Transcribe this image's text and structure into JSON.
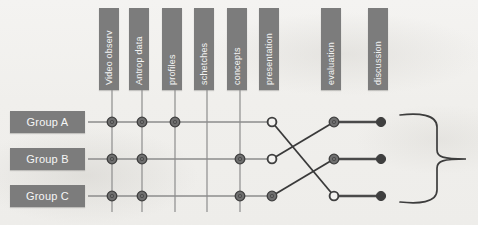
{
  "figure": {
    "background_color": "#f2f1ef",
    "bar_color": "#7c7c7c",
    "label_color": "#f4f4f4",
    "line_color": "#8d8d8d",
    "cross_line_color": "#3a3a3a",
    "node_fill_color": "#6f6f6f",
    "node_dark_color": "#3f3f3f"
  },
  "columns": [
    {
      "id": "video-observ",
      "label": "Video observ",
      "x": 112,
      "bar_x": 99,
      "bar_y": 8,
      "bar_w": 20,
      "bar_h": 82,
      "has_grid_line": true
    },
    {
      "id": "antrop-data",
      "label": "Antrop data",
      "x": 142,
      "bar_x": 129,
      "bar_y": 8,
      "bar_w": 20,
      "bar_h": 82,
      "has_grid_line": true
    },
    {
      "id": "profiles",
      "label": "profiles",
      "x": 175,
      "bar_x": 162,
      "bar_y": 8,
      "bar_w": 20,
      "bar_h": 82,
      "has_grid_line": true
    },
    {
      "id": "schetches",
      "label": "schetches",
      "x": 207,
      "bar_x": 194,
      "bar_y": 8,
      "bar_w": 20,
      "bar_h": 82,
      "has_grid_line": true
    },
    {
      "id": "concepts",
      "label": "concepts",
      "x": 240,
      "bar_x": 227,
      "bar_y": 8,
      "bar_w": 20,
      "bar_h": 82,
      "has_grid_line": true
    },
    {
      "id": "presentation",
      "label": "presentation",
      "x": 272,
      "bar_x": 259,
      "bar_y": 8,
      "bar_w": 20,
      "bar_h": 82,
      "has_grid_line": false
    },
    {
      "id": "evaluation",
      "label": "evaluation",
      "x": 334,
      "bar_x": 321,
      "bar_y": 8,
      "bar_w": 20,
      "bar_h": 82,
      "has_grid_line": false
    },
    {
      "id": "discussion",
      "label": "discussion",
      "x": 381,
      "bar_x": 368,
      "bar_y": 8,
      "bar_w": 20,
      "bar_h": 82,
      "has_grid_line": false
    }
  ],
  "groups": [
    {
      "id": "group-a",
      "label": "Group A",
      "y": 122,
      "box_x": 10,
      "box_y": 111,
      "box_w": 75,
      "box_h": 22
    },
    {
      "id": "group-b",
      "label": "Group B",
      "y": 159,
      "box_x": 10,
      "box_y": 148,
      "box_w": 75,
      "box_h": 22
    },
    {
      "id": "group-c",
      "label": "Group C",
      "y": 196,
      "box_x": 10,
      "box_y": 185,
      "box_w": 75,
      "box_h": 22
    }
  ],
  "nodes": [
    {
      "group": "group-a",
      "column": "video-observ",
      "x": 112,
      "y": 122,
      "style": "filled"
    },
    {
      "group": "group-a",
      "column": "antrop-data",
      "x": 142,
      "y": 122,
      "style": "filled"
    },
    {
      "group": "group-a",
      "column": "profiles",
      "x": 175,
      "y": 122,
      "style": "filled"
    },
    {
      "group": "group-a",
      "column": "presentation",
      "x": 272,
      "y": 122,
      "style": "hollow"
    },
    {
      "group": "group-b",
      "column": "video-observ",
      "x": 112,
      "y": 159,
      "style": "filled"
    },
    {
      "group": "group-b",
      "column": "antrop-data",
      "x": 142,
      "y": 159,
      "style": "filled"
    },
    {
      "group": "group-b",
      "column": "concepts",
      "x": 240,
      "y": 159,
      "style": "filled"
    },
    {
      "group": "group-b",
      "column": "presentation",
      "x": 272,
      "y": 159,
      "style": "hollow"
    },
    {
      "group": "group-c",
      "column": "video-observ",
      "x": 112,
      "y": 196,
      "style": "filled"
    },
    {
      "group": "group-c",
      "column": "antrop-data",
      "x": 142,
      "y": 196,
      "style": "filled"
    },
    {
      "group": "group-c",
      "column": "concepts",
      "x": 240,
      "y": 196,
      "style": "filled"
    },
    {
      "group": "group-c",
      "column": "presentation",
      "x": 272,
      "y": 196,
      "style": "filled"
    }
  ],
  "right_nodes": [
    {
      "id": "eval-a",
      "column": "evaluation",
      "x": 334,
      "y": 122,
      "style": "filled"
    },
    {
      "id": "eval-b",
      "column": "evaluation",
      "x": 334,
      "y": 159,
      "style": "filled"
    },
    {
      "id": "eval-c",
      "column": "evaluation",
      "x": 334,
      "y": 196,
      "style": "hollow"
    },
    {
      "id": "disc-a",
      "column": "discussion",
      "x": 381,
      "y": 122,
      "style": "dark"
    },
    {
      "id": "disc-b",
      "column": "discussion",
      "x": 381,
      "y": 159,
      "style": "dark"
    },
    {
      "id": "disc-c",
      "column": "discussion",
      "x": 381,
      "y": 196,
      "style": "dark"
    }
  ],
  "row_spans": [
    {
      "group": "group-a",
      "x1": 88,
      "x2": 272,
      "y": 122
    },
    {
      "group": "group-b",
      "x1": 88,
      "x2": 272,
      "y": 159
    },
    {
      "group": "group-c",
      "x1": 88,
      "x2": 272,
      "y": 196
    }
  ],
  "cross_links": [
    {
      "from": "group-a-presentation",
      "to": "eval-c",
      "x1": 272,
      "y1": 122,
      "x2": 334,
      "y2": 196
    },
    {
      "from": "group-b-presentation",
      "to": "eval-a",
      "x1": 272,
      "y1": 159,
      "x2": 334,
      "y2": 122
    },
    {
      "from": "group-c-presentation",
      "to": "eval-b",
      "x1": 272,
      "y1": 196,
      "x2": 334,
      "y2": 159
    }
  ],
  "right_links": [
    {
      "from": "eval-a",
      "to": "disc-a",
      "x1": 334,
      "y1": 122,
      "x2": 381,
      "y2": 122
    },
    {
      "from": "eval-b",
      "to": "disc-b",
      "x1": 334,
      "y1": 159,
      "x2": 381,
      "y2": 159
    },
    {
      "from": "eval-c",
      "to": "disc-c",
      "x1": 334,
      "y1": 196,
      "x2": 381,
      "y2": 196
    }
  ],
  "brace": {
    "label": "",
    "top_y": 113,
    "bottom_y": 204,
    "mid_y": 159,
    "left_x": 400,
    "spine_x": 437,
    "tip_x": 466
  }
}
